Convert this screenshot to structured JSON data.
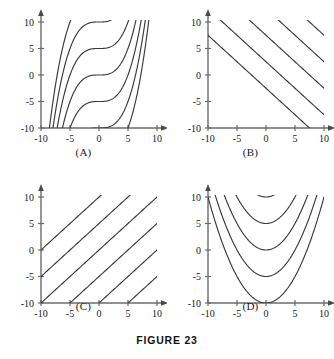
{
  "figure": {
    "caption": "FIGURE 23",
    "panels": [
      {
        "id": "A",
        "label": "(A)",
        "name": "panel-a-cubic-family",
        "xlabel": "",
        "ylabel": "",
        "x_ticks": [
          "-10",
          "-5",
          "0",
          "5",
          "10"
        ],
        "y_ticks": [
          "-10",
          "-5",
          "0",
          "5",
          "10"
        ],
        "x_tick_values": [
          -10,
          -5,
          0,
          5,
          10
        ],
        "y_tick_values": [
          -10,
          -5,
          0,
          5,
          10
        ],
        "xlim": [
          -10,
          10
        ],
        "ylim": [
          -10,
          10
        ],
        "curve_kind": "cubic",
        "description": "Family of S-shaped cubic curves with inflection points on the y-axis",
        "offsets": [
          -10,
          -5,
          0,
          5,
          10,
          15,
          -15
        ],
        "coefficient": 0.04
      },
      {
        "id": "B",
        "label": "(B)",
        "name": "panel-b-negative-slope-lines",
        "xlabel": "",
        "ylabel": "",
        "x_ticks": [
          "-10",
          "-5",
          "0",
          "5",
          "10"
        ],
        "y_ticks": [
          "-10",
          "-5",
          "0",
          "5",
          "10"
        ],
        "x_tick_values": [
          -10,
          -5,
          0,
          5,
          10
        ],
        "y_tick_values": [
          -10,
          -5,
          0,
          5,
          10
        ],
        "xlim": [
          -10,
          10
        ],
        "ylim": [
          -10,
          10
        ],
        "curve_kind": "line",
        "description": "Family of parallel straight lines with slope -1",
        "slope": -1,
        "intercepts": [
          -2.5,
          2.5,
          7.5,
          12.5,
          17.5,
          22.5
        ]
      },
      {
        "id": "C",
        "label": "(C)",
        "name": "panel-c-positive-slope-lines",
        "xlabel": "",
        "ylabel": "",
        "x_ticks": [
          "-10",
          "-5",
          "0",
          "5",
          "10"
        ],
        "y_ticks": [
          "-10",
          "-5",
          "0",
          "5",
          "10"
        ],
        "x_tick_values": [
          -10,
          -5,
          0,
          5,
          10
        ],
        "y_tick_values": [
          -10,
          -5,
          0,
          5,
          10
        ],
        "xlim": [
          -10,
          10
        ],
        "ylim": [
          -10,
          10
        ],
        "curve_kind": "line",
        "description": "Family of parallel straight lines with slope +1",
        "slope": 1,
        "intercepts": [
          10,
          5,
          0,
          -5,
          -10,
          -15,
          -20
        ]
      },
      {
        "id": "D",
        "label": "(D)",
        "name": "panel-d-parabola-family",
        "xlabel": "",
        "ylabel": "",
        "x_ticks": [
          "-10",
          "-5",
          "0",
          "5",
          "10"
        ],
        "y_ticks": [
          "-10",
          "-5",
          "0",
          "5",
          "10"
        ],
        "x_tick_values": [
          -10,
          -5,
          0,
          5,
          10
        ],
        "y_tick_values": [
          -10,
          -5,
          0,
          5,
          10
        ],
        "xlim": [
          -10,
          10
        ],
        "ylim": [
          -10,
          10
        ],
        "curve_kind": "parabola",
        "description": "Family of upward-opening parabolas with vertices on the y-axis",
        "vertices": [
          10,
          5,
          0,
          -5,
          -10
        ],
        "coefficient": 0.2
      }
    ]
  },
  "chart_data": [
    {
      "type": "line",
      "title": "(A)",
      "xlabel": "",
      "ylabel": "",
      "xlim": [
        -10,
        10
      ],
      "ylim": [
        -10,
        10
      ],
      "xticks": [
        -10,
        -5,
        0,
        5,
        10
      ],
      "yticks": [
        -10,
        -5,
        0,
        5,
        10
      ],
      "grid": false,
      "legend": "none",
      "family": "y = 0.04*x^3 + C",
      "series": [
        {
          "name": "C = 15",
          "C": 15
        },
        {
          "name": "C = 10",
          "C": 10
        },
        {
          "name": "C = 5",
          "C": 5
        },
        {
          "name": "C = 0",
          "C": 0
        },
        {
          "name": "C = -5",
          "C": -5
        },
        {
          "name": "C = -10",
          "C": -10
        },
        {
          "name": "C = -15",
          "C": -15
        }
      ]
    },
    {
      "type": "line",
      "title": "(B)",
      "xlabel": "",
      "ylabel": "",
      "xlim": [
        -10,
        10
      ],
      "ylim": [
        -10,
        10
      ],
      "xticks": [
        -10,
        -5,
        0,
        5,
        10
      ],
      "yticks": [
        -10,
        -5,
        0,
        5,
        10
      ],
      "grid": false,
      "legend": "none",
      "family": "y = -x + C",
      "series": [
        {
          "name": "C = -2.5",
          "C": -2.5
        },
        {
          "name": "C = 2.5",
          "C": 2.5
        },
        {
          "name": "C = 7.5",
          "C": 7.5
        },
        {
          "name": "C = 12.5",
          "C": 12.5
        },
        {
          "name": "C = 17.5",
          "C": 17.5
        },
        {
          "name": "C = 22.5",
          "C": 22.5
        }
      ]
    },
    {
      "type": "line",
      "title": "(C)",
      "xlabel": "",
      "ylabel": "",
      "xlim": [
        -10,
        10
      ],
      "ylim": [
        -10,
        10
      ],
      "xticks": [
        -10,
        -5,
        0,
        5,
        10
      ],
      "yticks": [
        -10,
        -5,
        0,
        5,
        10
      ],
      "grid": false,
      "legend": "none",
      "family": "y = x + C",
      "series": [
        {
          "name": "C = 10",
          "C": 10
        },
        {
          "name": "C = 5",
          "C": 5
        },
        {
          "name": "C = 0",
          "C": 0
        },
        {
          "name": "C = -5",
          "C": -5
        },
        {
          "name": "C = -10",
          "C": -10
        },
        {
          "name": "C = -15",
          "C": -15
        },
        {
          "name": "C = -20",
          "C": -20
        }
      ]
    },
    {
      "type": "line",
      "title": "(D)",
      "xlabel": "",
      "ylabel": "",
      "xlim": [
        -10,
        10
      ],
      "ylim": [
        -10,
        10
      ],
      "xticks": [
        -10,
        -5,
        0,
        5,
        10
      ],
      "yticks": [
        -10,
        -5,
        0,
        5,
        10
      ],
      "grid": false,
      "legend": "none",
      "family": "y = 0.2*x^2 + C",
      "series": [
        {
          "name": "C = 10",
          "C": 10
        },
        {
          "name": "C = 5",
          "C": 5
        },
        {
          "name": "C = 0",
          "C": 0
        },
        {
          "name": "C = -5",
          "C": -5
        },
        {
          "name": "C = -10",
          "C": -10
        }
      ]
    }
  ]
}
